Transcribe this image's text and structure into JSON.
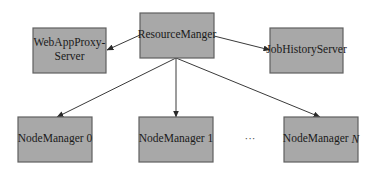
{
  "diagram": {
    "type": "architecture",
    "nodes": [
      {
        "id": "rm",
        "lines": [
          "ResourceManger"
        ],
        "italic_suffix": ""
      },
      {
        "id": "wap",
        "lines": [
          "WebAppProxy-",
          "Server"
        ],
        "italic_suffix": ""
      },
      {
        "id": "jhs",
        "lines": [
          "JobHistoryServer"
        ],
        "italic_suffix": ""
      },
      {
        "id": "nm0",
        "lines": [
          "NodeManager 0"
        ],
        "italic_suffix": ""
      },
      {
        "id": "nm1",
        "lines": [
          "NodeManager 1"
        ],
        "italic_suffix": ""
      },
      {
        "id": "nmN",
        "lines": [
          "NodeManager "
        ],
        "italic_suffix": "N"
      }
    ],
    "edges": [
      {
        "from": "rm",
        "to": "wap"
      },
      {
        "from": "rm",
        "to": "jhs"
      },
      {
        "from": "rm",
        "to": "nm0"
      },
      {
        "from": "rm",
        "to": "nm1"
      },
      {
        "from": "rm",
        "to": "nmN"
      }
    ],
    "ellipsis": "···",
    "colors": {
      "box_fill": "#a8a8a8",
      "box_border": "#606060",
      "text": "#1a1a1a",
      "edge": "#3a3a3a"
    }
  }
}
